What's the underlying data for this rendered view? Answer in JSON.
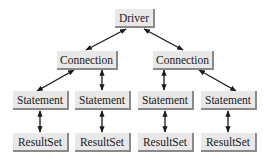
{
  "diagram": {
    "nodes": {
      "driver": "Driver",
      "connection_left": "Connection",
      "connection_right": "Connection",
      "statement_1": "Statement",
      "statement_2": "Statement",
      "statement_3": "Statement",
      "statement_4": "Statement",
      "resultset_1": "ResultSet",
      "resultset_2": "ResultSet",
      "resultset_3": "ResultSet",
      "resultset_4": "ResultSet"
    },
    "edges": [
      [
        "driver",
        "connection_left"
      ],
      [
        "driver",
        "connection_right"
      ],
      [
        "connection_left",
        "statement_1"
      ],
      [
        "connection_left",
        "statement_2"
      ],
      [
        "connection_right",
        "statement_3"
      ],
      [
        "connection_right",
        "statement_4"
      ],
      [
        "statement_1",
        "resultset_1"
      ],
      [
        "statement_2",
        "resultset_2"
      ],
      [
        "statement_3",
        "resultset_3"
      ],
      [
        "statement_4",
        "resultset_4"
      ]
    ],
    "edge_style": "bidirectional-arrow"
  }
}
